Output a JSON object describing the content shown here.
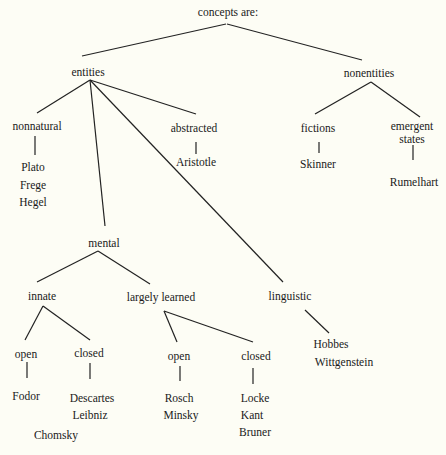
{
  "diagram": {
    "title": "concepts are:",
    "nodes": {
      "root": {
        "label": "concepts are:",
        "x": 228,
        "y": 6
      },
      "entities": {
        "label": "entities",
        "x": 88,
        "y": 66
      },
      "nonentities": {
        "label": "nonentities",
        "x": 369,
        "y": 67
      },
      "nonnatural": {
        "label": "nonnatural",
        "x": 37,
        "y": 120
      },
      "abstracted": {
        "label": "abstracted",
        "x": 194,
        "y": 122
      },
      "fictions": {
        "label": "fictions",
        "x": 318,
        "y": 122
      },
      "emergent_states": {
        "label": "emergent",
        "label2": "states",
        "x": 412,
        "y": 120
      },
      "aristotle": {
        "label": "Aristotle",
        "x": 196,
        "y": 156
      },
      "skinner": {
        "label": "Skinner",
        "x": 318,
        "y": 158
      },
      "rumelhart": {
        "label": "Rumelhart",
        "x": 414,
        "y": 176
      },
      "plato": {
        "label": "Plato",
        "x": 33,
        "y": 161
      },
      "frege": {
        "label": "Frege",
        "x": 33,
        "y": 179
      },
      "hegel": {
        "label": "Hegel",
        "x": 33,
        "y": 196
      },
      "mental": {
        "label": "mental",
        "x": 104,
        "y": 237
      },
      "innate": {
        "label": "innate",
        "x": 42,
        "y": 290
      },
      "largely_learned": {
        "label": "largely learned",
        "x": 161,
        "y": 291
      },
      "linguistic": {
        "label": "linguistic",
        "x": 290,
        "y": 290
      },
      "innate_open": {
        "label": "open",
        "x": 26,
        "y": 348
      },
      "innate_closed": {
        "label": "closed",
        "x": 89,
        "y": 347
      },
      "learned_open": {
        "label": "open",
        "x": 179,
        "y": 350
      },
      "learned_closed": {
        "label": "closed",
        "x": 256,
        "y": 350
      },
      "fodor": {
        "label": "Fodor",
        "x": 26,
        "y": 390
      },
      "descartes": {
        "label": "Descartes",
        "x": 92,
        "y": 392
      },
      "leibniz": {
        "label": "Leibniz",
        "x": 90,
        "y": 409
      },
      "chomsky": {
        "label": "Chomsky",
        "x": 56,
        "y": 429
      },
      "rosch": {
        "label": "Rosch",
        "x": 179,
        "y": 392
      },
      "minsky": {
        "label": "Minsky",
        "x": 181,
        "y": 409
      },
      "locke": {
        "label": "Locke",
        "x": 255,
        "y": 392
      },
      "kant": {
        "label": "Kant",
        "x": 252,
        "y": 409
      },
      "bruner": {
        "label": "Bruner",
        "x": 255,
        "y": 426
      },
      "hobbes": {
        "label": "Hobbes",
        "x": 331,
        "y": 338
      },
      "wittgenstein": {
        "label": "Wittgenstein",
        "x": 344,
        "y": 356
      }
    },
    "edges": [
      {
        "from": "root",
        "to": "entities",
        "x1": 226,
        "y1": 24,
        "x2": 82,
        "y2": 56
      },
      {
        "from": "root",
        "to": "nonentities",
        "x1": 227,
        "y1": 24,
        "x2": 362,
        "y2": 60
      },
      {
        "from": "entities",
        "to": "nonnatural",
        "x1": 90,
        "y1": 80,
        "x2": 37,
        "y2": 113
      },
      {
        "from": "entities",
        "to": "mental",
        "x1": 90,
        "y1": 80,
        "x2": 105,
        "y2": 226
      },
      {
        "from": "entities",
        "to": "linguistic",
        "x1": 90,
        "y1": 80,
        "x2": 283,
        "y2": 282
      },
      {
        "from": "entities",
        "to": "abstracted",
        "x1": 90,
        "y1": 80,
        "x2": 196,
        "y2": 114
      },
      {
        "from": "nonentities",
        "to": "fictions",
        "x1": 371,
        "y1": 82,
        "x2": 315,
        "y2": 114
      },
      {
        "from": "nonentities",
        "to": "emergent_states",
        "x1": 371,
        "y1": 82,
        "x2": 420,
        "y2": 117
      },
      {
        "from": "nonnatural",
        "to": "plato",
        "x1": 35,
        "y1": 136,
        "x2": 35,
        "y2": 155
      },
      {
        "from": "abstracted",
        "to": "aristotle",
        "x1": 196,
        "y1": 142,
        "x2": 196,
        "y2": 154
      },
      {
        "from": "fictions",
        "to": "skinner",
        "x1": 319,
        "y1": 142,
        "x2": 319,
        "y2": 153
      },
      {
        "from": "emergent_states",
        "to": "rumelhart",
        "x1": 413,
        "y1": 145,
        "x2": 413,
        "y2": 160
      },
      {
        "from": "mental",
        "to": "innate",
        "x1": 98,
        "y1": 251,
        "x2": 37,
        "y2": 282
      },
      {
        "from": "mental",
        "to": "largely_learned",
        "x1": 98,
        "y1": 251,
        "x2": 150,
        "y2": 284
      },
      {
        "from": "innate",
        "to": "innate_open",
        "x1": 43,
        "y1": 306,
        "x2": 25,
        "y2": 340
      },
      {
        "from": "innate",
        "to": "innate_closed",
        "x1": 43,
        "y1": 306,
        "x2": 90,
        "y2": 340
      },
      {
        "from": "innate_open",
        "to": "fodor",
        "x1": 27,
        "y1": 362,
        "x2": 27,
        "y2": 378
      },
      {
        "from": "innate_closed",
        "to": "descartes",
        "x1": 90,
        "y1": 363,
        "x2": 90,
        "y2": 379
      },
      {
        "from": "largely_learned",
        "to": "learned_open",
        "x1": 164,
        "y1": 311,
        "x2": 177,
        "y2": 342
      },
      {
        "from": "largely_learned",
        "to": "learned_closed",
        "x1": 164,
        "y1": 311,
        "x2": 253,
        "y2": 342
      },
      {
        "from": "learned_open",
        "to": "rosch",
        "x1": 180,
        "y1": 366,
        "x2": 180,
        "y2": 381
      },
      {
        "from": "learned_closed",
        "to": "locke",
        "x1": 253,
        "y1": 368,
        "x2": 253,
        "y2": 384
      },
      {
        "from": "linguistic",
        "to": "hobbes",
        "x1": 305,
        "y1": 310,
        "x2": 329,
        "y2": 333
      }
    ]
  }
}
